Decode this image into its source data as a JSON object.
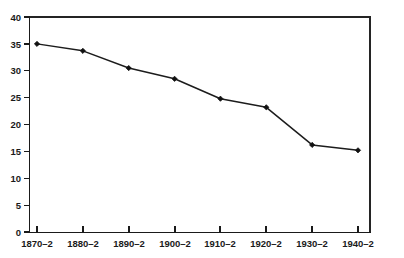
{
  "chart_data": {
    "type": "line",
    "title": "",
    "subtitle": "",
    "xlabel": "",
    "ylabel": "",
    "categories": [
      "1870–2",
      "1880–2",
      "1890–2",
      "1900–2",
      "1910–2",
      "1920–2",
      "1930–2",
      "1940–2"
    ],
    "values": [
      35.0,
      33.7,
      30.5,
      28.5,
      24.8,
      23.2,
      16.2,
      15.2
    ],
    "series": [
      {
        "name": "series-1",
        "values": [
          35.0,
          33.7,
          30.5,
          28.5,
          24.8,
          23.2,
          16.2,
          15.2
        ]
      }
    ],
    "ylim": [
      0,
      40
    ],
    "yticks": [
      0,
      5,
      10,
      15,
      20,
      25,
      30,
      35,
      40
    ],
    "ytick_labels": [
      "0",
      "5",
      "10",
      "15",
      "20",
      "25",
      "30",
      "35",
      "40"
    ],
    "xtick_labels": [
      "1870–2",
      "1880–2",
      "1890–2",
      "1900–2",
      "1910–2",
      "1920–2",
      "1930–2",
      "1940–2"
    ],
    "grid": false,
    "legend": false,
    "legend_position": "none",
    "marker": "filled-diamond",
    "line_color": "#1c1c1c",
    "marker_color": "#111111",
    "background_color": "#ffffff",
    "annotations": []
  },
  "axes": {
    "y_axis_name": "y-axis",
    "x_axis_name": "x-axis"
  }
}
